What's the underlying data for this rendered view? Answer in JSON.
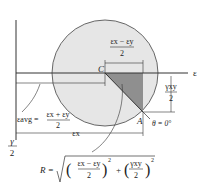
{
  "diagram": {
    "colors": {
      "circle_fill": "#e6e6e6",
      "triangle_fill": "#8f8f8f",
      "lines": "#333333"
    },
    "axes": {
      "horizontal_label": "ε",
      "vertical_label_num": "γ",
      "vertical_label_den": "2"
    },
    "points": {
      "center": "C",
      "reference": "A",
      "angle_label": "θ = 0°"
    },
    "dimensions": {
      "half_diff_num": "εx − εy",
      "half_diff_den": "2",
      "gamma_num": "γxy",
      "gamma_den": "2",
      "avg_lhs": "εavg =",
      "avg_num": "εx + εy",
      "avg_den": "2",
      "ex_label": "εx"
    },
    "formula": {
      "lhs": "R =",
      "term1_num": "εx − εy",
      "term1_den": "2",
      "term2_num": "γxy",
      "term2_den": "2",
      "plus": "+",
      "exp": "2"
    }
  }
}
